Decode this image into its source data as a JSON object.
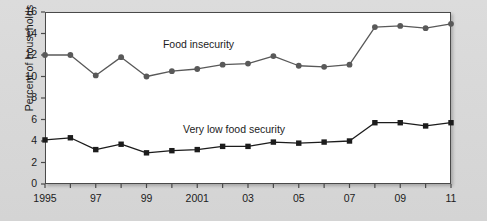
{
  "chart_data": {
    "type": "line",
    "title": "",
    "subtitle": "",
    "xlabel": "",
    "ylabel": "Percent of households",
    "xlim": [
      1995,
      2011
    ],
    "ylim": [
      0,
      16
    ],
    "ytick_step": 2,
    "yticks": [
      0,
      2,
      4,
      6,
      8,
      10,
      12,
      14,
      16
    ],
    "ytick_labels": [
      "0",
      "2",
      "4",
      "6",
      "8",
      "10",
      "12",
      "14",
      "16"
    ],
    "x": [
      1995,
      1996,
      1997,
      1998,
      1999,
      2000,
      2001,
      2002,
      2003,
      2004,
      2005,
      2006,
      2007,
      2008,
      2009,
      2010,
      2011
    ],
    "xtick_values": [
      1995,
      1996,
      1997,
      1998,
      1999,
      2000,
      2001,
      2002,
      2003,
      2004,
      2005,
      2006,
      2007,
      2008,
      2009,
      2010,
      2011
    ],
    "xtick_labels": [
      {
        "value": 1995,
        "label": "1995"
      },
      {
        "value": 1997,
        "label": "97"
      },
      {
        "value": 1999,
        "label": "99"
      },
      {
        "value": 2001,
        "label": "2001"
      },
      {
        "value": 2003,
        "label": "03"
      },
      {
        "value": 2005,
        "label": "05"
      },
      {
        "value": 2007,
        "label": "07"
      },
      {
        "value": 2009,
        "label": "09"
      },
      {
        "value": 2011,
        "label": "11"
      }
    ],
    "grid": false,
    "legend": "inline-annotations",
    "series": [
      {
        "name": "Food insecurity",
        "marker": "circle",
        "color": "#595959",
        "label_x": 2001.05,
        "label_y": 12.9,
        "values": [
          12.0,
          12.0,
          10.1,
          11.8,
          10.0,
          10.5,
          10.7,
          11.1,
          11.2,
          11.9,
          11.0,
          10.9,
          11.1,
          14.6,
          14.7,
          14.5,
          14.9
        ]
      },
      {
        "name": "Very low food security",
        "marker": "square",
        "color": "#1c1c1c",
        "label_x": 2002.45,
        "label_y": 5.05,
        "values": [
          4.1,
          4.3,
          3.2,
          3.7,
          2.9,
          3.1,
          3.2,
          3.5,
          3.5,
          3.9,
          3.8,
          3.9,
          4.0,
          5.7,
          5.7,
          5.4,
          5.7
        ]
      }
    ]
  },
  "axis": {
    "y_title": "Percent of households"
  }
}
